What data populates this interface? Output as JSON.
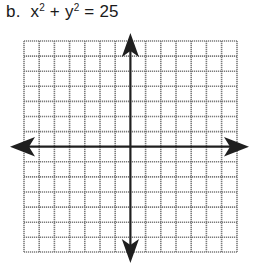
{
  "problem": {
    "letter": "b.",
    "equation_parts": {
      "x": "x",
      "x_exp": "2",
      "plus": "+",
      "y": "y",
      "y_exp": "2",
      "equals": "=",
      "rhs": "25"
    },
    "equation_text": "x² + y² = 25"
  },
  "graph": {
    "grid_columns": 14,
    "grid_rows": 14,
    "grid_color": "#7a7a7a",
    "axis_color": "#1f1f1f",
    "axes": [
      "x-axis",
      "y-axis"
    ],
    "arrows": [
      "up",
      "down",
      "left",
      "right"
    ]
  }
}
